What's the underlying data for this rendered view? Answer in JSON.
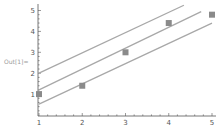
{
  "cell": {
    "out_label": "Out[1]="
  },
  "colors": {
    "line": "#a8a8a8",
    "marker": "#8a8a8a",
    "axis": "#555555",
    "background": "#ffffff"
  },
  "chart_data": {
    "type": "scatter",
    "title": "",
    "xlabel": "",
    "ylabel": "",
    "xlim": [
      1,
      5
    ],
    "ylim": [
      0,
      5.2
    ],
    "grid": false,
    "legend": null,
    "x_ticks": [
      "1",
      "2",
      "3",
      "4",
      "5"
    ],
    "y_ticks": [
      "1",
      "2",
      "3",
      "4",
      "5"
    ],
    "points": {
      "name": "data",
      "x": [
        1,
        2,
        3,
        4,
        5
      ],
      "y": [
        1.0,
        1.4,
        3.0,
        4.4,
        4.8
      ],
      "marker": "square"
    },
    "lines": [
      {
        "name": "upper-band",
        "slope": 0.97,
        "intercept": 1.03,
        "x_range": [
          1,
          4.35
        ]
      },
      {
        "name": "fit",
        "slope": 1.0,
        "intercept": 0.2,
        "x_range": [
          1,
          4.75
        ]
      },
      {
        "name": "lower-band",
        "slope": 0.97,
        "intercept": -0.45,
        "x_range": [
          1,
          5
        ]
      }
    ]
  }
}
